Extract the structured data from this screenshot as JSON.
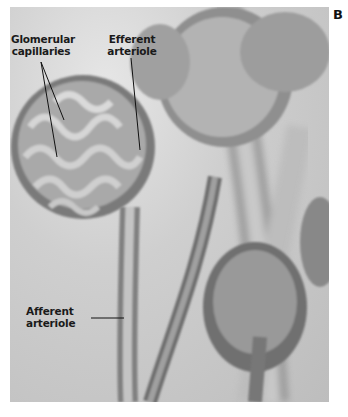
{
  "figure": {
    "panel_letter": "B",
    "labels": {
      "glomerular_capillaries": [
        "Glomerular",
        "capillaries"
      ],
      "efferent_arteriole": [
        "Efferent",
        "arteriole"
      ],
      "afferent_arteriole": [
        "Afferent",
        "arteriole"
      ]
    },
    "colors": {
      "background": "#ffffff",
      "photo_light": "#e6e6e6",
      "photo_mid": "#a8a8a8",
      "photo_dark": "#5a5a5a",
      "label_text": "#1a1a1a"
    }
  }
}
